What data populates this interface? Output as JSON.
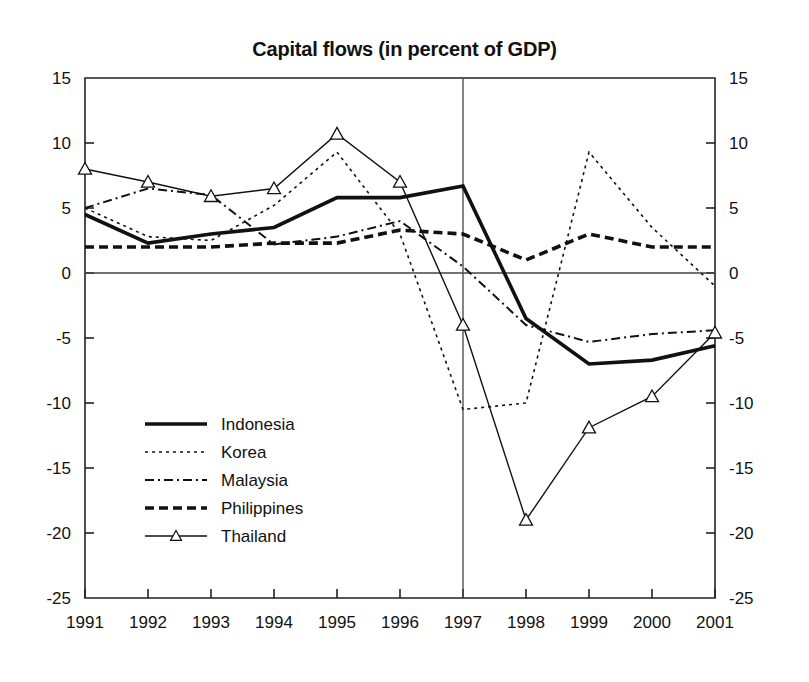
{
  "chart_data": {
    "type": "line",
    "title": "Capital flows (in percent of GDP)",
    "xlabel": "",
    "ylabel": "",
    "categories": [
      "1991",
      "1992",
      "1993",
      "1994",
      "1995",
      "1996",
      "1997",
      "1998",
      "1999",
      "2000",
      "2001"
    ],
    "x": [
      1991,
      1992,
      1993,
      1994,
      1995,
      1996,
      1997,
      1998,
      1999,
      2000,
      2001
    ],
    "ylim": [
      -25,
      15
    ],
    "xlim": [
      1991,
      2001
    ],
    "yticks": [
      15,
      10,
      5,
      0,
      -5,
      -10,
      -15,
      -20,
      -25
    ],
    "ytick_labels": [
      "15",
      "10",
      "5",
      "0",
      "-5",
      "-10",
      "-15",
      "-20",
      "-25"
    ],
    "right_axis_ticks": [
      "15",
      "10",
      "5",
      "0",
      "-5",
      "-10",
      "-15",
      "-20",
      "-25"
    ],
    "grid": false,
    "legend_position": "lower-left-inside",
    "annotations": [
      {
        "type": "vertical-line",
        "x": 1997,
        "label": ""
      },
      {
        "type": "horizontal-line",
        "y": 0,
        "label": ""
      }
    ],
    "series": [
      {
        "name": "Indonesia",
        "style": "solid-thick",
        "marker": "none",
        "color": "#111111",
        "values": [
          4.5,
          2.3,
          3.0,
          3.5,
          5.8,
          5.8,
          6.7,
          -3.5,
          -7.0,
          -6.7,
          -5.6
        ]
      },
      {
        "name": "Korea",
        "style": "dotted",
        "marker": "none",
        "color": "#111111",
        "values": [
          5.0,
          2.8,
          2.5,
          5.2,
          9.3,
          3.0,
          -10.5,
          -10.0,
          9.3,
          3.5,
          -1.0
        ]
      },
      {
        "name": "Malaysia",
        "style": "dash-dot",
        "marker": "none",
        "color": "#111111",
        "values": [
          5.0,
          6.5,
          6.0,
          2.2,
          2.8,
          4.0,
          0.5,
          -4.0,
          -5.3,
          -4.7,
          -4.4
        ]
      },
      {
        "name": "Philippines",
        "style": "dashed-thick",
        "marker": "none",
        "color": "#111111",
        "values": [
          2.0,
          2.0,
          2.0,
          2.3,
          2.3,
          3.3,
          3.0,
          1.0,
          3.0,
          2.0,
          2.0
        ]
      },
      {
        "name": "Thailand",
        "style": "solid-thin",
        "marker": "triangle",
        "color": "#111111",
        "values": [
          8.0,
          7.0,
          5.9,
          6.5,
          10.7,
          7.0,
          -4.0,
          -19.0,
          -11.9,
          -9.5,
          -4.6
        ]
      }
    ]
  },
  "legend": {
    "entries": [
      {
        "label": "Indonesia"
      },
      {
        "label": "Korea"
      },
      {
        "label": "Malaysia"
      },
      {
        "label": "Philippines"
      },
      {
        "label": "Thailand"
      }
    ]
  }
}
